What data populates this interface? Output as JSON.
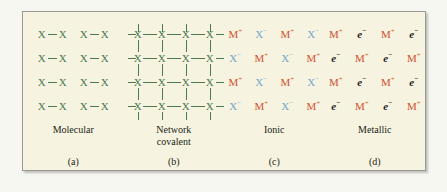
{
  "figure": {
    "background_color": "#f6f4e0",
    "border_color": "#9a9a94",
    "panels": [
      {
        "id": "molecular",
        "name": "Molecular",
        "letter": "(a)",
        "type": "molecular",
        "atom_label": "X",
        "bond_symbol": "—",
        "color": "#4e7a53",
        "rows": 4,
        "pairs_per_row": 2,
        "grid": [
          [
            "X—X",
            "X—X"
          ],
          [
            "X—X",
            "X—X"
          ],
          [
            "X—X",
            "X—X"
          ],
          [
            "X—X",
            "X—X"
          ]
        ]
      },
      {
        "id": "network-covalent",
        "name": "Network covalent",
        "name_line1": "Network",
        "name_line2": "covalent",
        "letter": "(b)",
        "type": "network",
        "atom_label": "X",
        "color": "#4e7a53",
        "rows": 4,
        "cols": 4,
        "has_edge_bonds": true
      },
      {
        "id": "ionic",
        "name": "Ionic",
        "letter": "(c)",
        "type": "ionic",
        "cation": "M",
        "cation_charge": "+",
        "cation_color": "#d2502f",
        "anion": "X",
        "anion_charge": "−",
        "anion_color": "#79a6cc",
        "grid": [
          [
            "M+",
            "X-",
            "M+",
            "X-"
          ],
          [
            "X-",
            "M+",
            "X-",
            "M+"
          ],
          [
            "M+",
            "X-",
            "M+",
            "X-"
          ],
          [
            "X-",
            "M+",
            "X-",
            "M+"
          ]
        ]
      },
      {
        "id": "metallic",
        "name": "Metallic",
        "letter": "(d)",
        "type": "metallic",
        "cation": "M",
        "cation_charge": "+",
        "cation_color": "#d2502f",
        "electron": "e",
        "electron_charge": "−",
        "electron_color": "#2b2118",
        "grid": [
          [
            "M+",
            "e-",
            "M+",
            "e-"
          ],
          [
            "e-",
            "M+",
            "e-",
            "M+"
          ],
          [
            "M+",
            "e-",
            "M+",
            "e-"
          ],
          [
            "e-",
            "M+",
            "e-",
            "M+"
          ]
        ]
      }
    ]
  }
}
